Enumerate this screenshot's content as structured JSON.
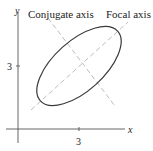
{
  "diagram": {
    "type": "rotated-ellipse",
    "labels": {
      "conjugate_axis": "Conjugate axis",
      "focal_axis": "Focal axis",
      "x_axis": "x",
      "y_axis": "y",
      "x_tick": "3",
      "y_tick": "3"
    },
    "colors": {
      "ellipse": "#3a3a3a",
      "axes": "#444444",
      "dashed_axes": "#bbbbbb",
      "text": "#222222"
    },
    "center": [
      3,
      3
    ]
  }
}
